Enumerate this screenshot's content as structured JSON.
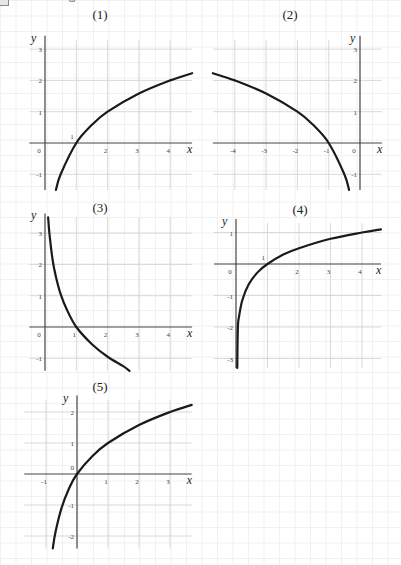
{
  "header": {
    "corner_glyph": "ω"
  },
  "chart_data": [
    {
      "type": "line",
      "title": "(1)",
      "xlabel": "x",
      "ylabel": "y",
      "xticks": [
        "0",
        "2",
        "3",
        "4"
      ],
      "yticks": [
        "3",
        "2",
        "1",
        "-1"
      ],
      "annotations": [
        "1"
      ],
      "xlim": [
        -0.5,
        4.7
      ],
      "ylim": [
        -1.5,
        3.3
      ],
      "grid": true,
      "series": [
        {
          "name": "curve",
          "x": [
            0.35,
            0.5,
            1,
            1.5,
            2,
            3,
            4,
            4.7
          ],
          "y": [
            -1.5,
            -1.0,
            0,
            0.58,
            1.0,
            1.58,
            2.0,
            2.23
          ]
        }
      ]
    },
    {
      "type": "line",
      "title": "(2)",
      "xlabel": "x",
      "ylabel": "y",
      "xticks": [
        "-4",
        "-3",
        "-2",
        "-1",
        "0"
      ],
      "yticks": [
        "3",
        "2",
        "1",
        "-1"
      ],
      "xlim": [
        -4.7,
        0.7
      ],
      "ylim": [
        -1.5,
        3.3
      ],
      "grid": true,
      "series": [
        {
          "name": "curve",
          "x": [
            -4.7,
            -4,
            -3,
            -2,
            -1.5,
            -1,
            -0.5,
            -0.35
          ],
          "y": [
            2.23,
            2.0,
            1.58,
            1.0,
            0.58,
            0,
            -1.0,
            -1.5
          ]
        }
      ]
    },
    {
      "type": "line",
      "title": "(3)",
      "xlabel": "x",
      "ylabel": "y",
      "xticks": [
        "0",
        "1",
        "2",
        "3",
        "4"
      ],
      "yticks": [
        "3",
        "2",
        "1",
        "-1"
      ],
      "xlim": [
        -0.5,
        4.7
      ],
      "ylim": [
        -1.4,
        3.5
      ],
      "grid": true,
      "series": [
        {
          "name": "curve",
          "x": [
            0.1,
            0.15,
            0.25,
            0.35,
            0.5,
            0.7,
            1,
            1.5,
            2,
            2.5,
            2.7
          ],
          "y": [
            3.5,
            2.9,
            2.1,
            1.6,
            1.05,
            0.55,
            0,
            -0.55,
            -0.95,
            -1.25,
            -1.4
          ]
        }
      ]
    },
    {
      "type": "line",
      "title": "(4)",
      "xlabel": "x",
      "ylabel": "y",
      "xticks": [
        "0",
        "2",
        "3",
        "4"
      ],
      "yticks": [
        "1",
        "-1",
        "-2",
        "-3"
      ],
      "annotations": [
        "1"
      ],
      "xlim": [
        -0.7,
        4.6
      ],
      "ylim": [
        -3.3,
        1.3
      ],
      "grid": true,
      "series": [
        {
          "name": "curve",
          "x": [
            0.04,
            0.06,
            0.1,
            0.2,
            0.4,
            0.7,
            1,
            1.5,
            2,
            3,
            4,
            4.6
          ],
          "y": [
            -3.3,
            -2.0,
            -1.65,
            -1.15,
            -0.65,
            -0.25,
            0,
            0.3,
            0.5,
            0.8,
            1.0,
            1.1
          ]
        }
      ]
    },
    {
      "type": "line",
      "title": "(5)",
      "xlabel": "x",
      "ylabel": "y",
      "xticks": [
        "-1",
        "1",
        "2",
        "3"
      ],
      "yticks": [
        "2",
        "1",
        "0",
        "-1",
        "-2"
      ],
      "xlim": [
        -1.7,
        3.7
      ],
      "ylim": [
        -2.4,
        2.4
      ],
      "grid": true,
      "series": [
        {
          "name": "curve",
          "x": [
            -0.78,
            -0.7,
            -0.5,
            -0.25,
            0,
            0.5,
            1,
            2,
            3,
            3.7
          ],
          "y": [
            -2.4,
            -1.9,
            -1.1,
            -0.45,
            0,
            0.58,
            1.0,
            1.58,
            2.0,
            2.23
          ]
        }
      ]
    }
  ]
}
